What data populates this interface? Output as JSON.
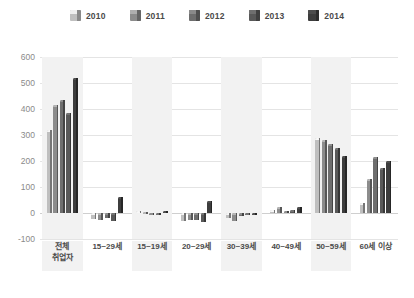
{
  "legend": {
    "items": [
      {
        "label": "2010",
        "color": "#bfbfbf",
        "icon": "cube-icon"
      },
      {
        "label": "2011",
        "color": "#8c8c8c",
        "icon": "cube-icon"
      },
      {
        "label": "2012",
        "color": "#6e6e6e",
        "icon": "cube-icon"
      },
      {
        "label": "2013",
        "color": "#595959",
        "icon": "cube-icon"
      },
      {
        "label": "2014",
        "color": "#3d3d3d",
        "icon": "cube-icon"
      }
    ]
  },
  "axis": {
    "y_ticks": [
      "600",
      "500",
      "400",
      "300",
      "200",
      "100",
      "0",
      "-100"
    ]
  },
  "chart_data": {
    "type": "bar",
    "title": "",
    "xlabel": "",
    "ylabel": "",
    "ylim": [
      -100,
      600
    ],
    "ystep": 100,
    "grid": true,
    "legend_position": "top-center",
    "categories": [
      "전체\n취업자",
      "15~29세",
      "15~19세",
      "20~29세",
      "30~39세",
      "40~49세",
      "50~59세",
      "60세 이상"
    ],
    "series": [
      {
        "name": "2010",
        "color": "#bfbfbf",
        "values": [
          320,
          -22,
          8,
          -30,
          -20,
          12,
          290,
          40
        ]
      },
      {
        "name": "2011",
        "color": "#8c8c8c",
        "values": [
          415,
          -25,
          5,
          -28,
          -32,
          25,
          280,
          130
        ]
      },
      {
        "name": "2012",
        "color": "#6e6e6e",
        "values": [
          435,
          -20,
          -4,
          -26,
          -10,
          8,
          265,
          215
        ]
      },
      {
        "name": "2013",
        "color": "#595959",
        "values": [
          385,
          -30,
          -6,
          -33,
          -8,
          10,
          250,
          175
        ]
      },
      {
        "name": "2014",
        "color": "#3d3d3d",
        "values": [
          520,
          62,
          7,
          48,
          -8,
          22,
          220,
          200
        ]
      }
    ]
  }
}
